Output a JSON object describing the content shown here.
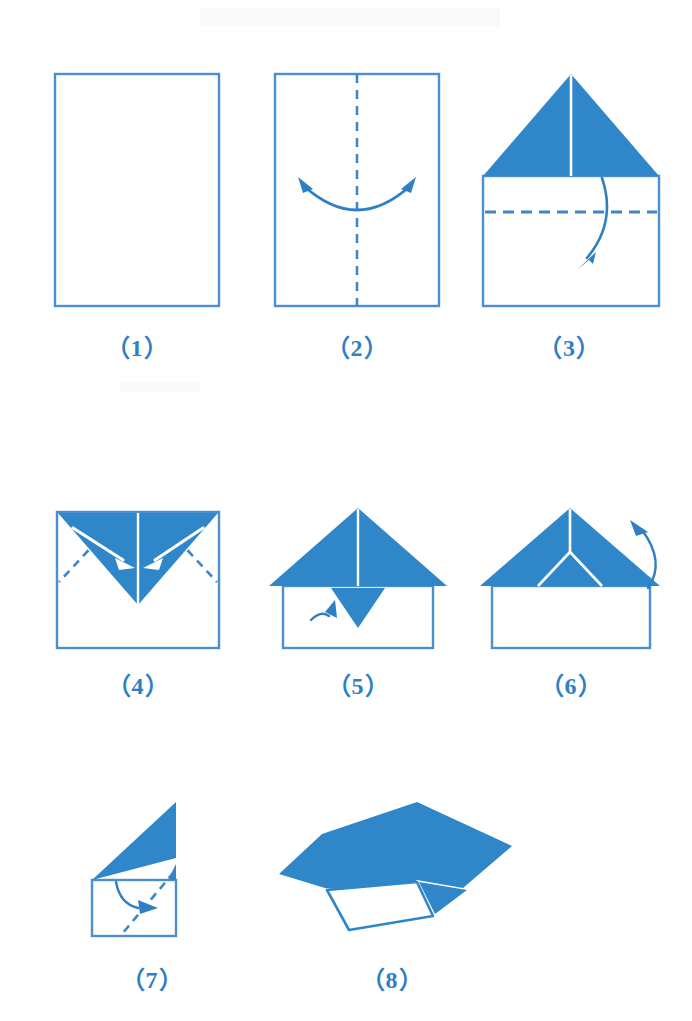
{
  "document": {
    "title": "Paper Airplane Folding Instructions",
    "kind": "origami-step-diagram",
    "step_count": 8,
    "background_color": "#ffffff"
  },
  "palette": {
    "paper_blue_fill": "#2f87c9",
    "outline_blue": "#4a90d0",
    "crease_dash_blue": "#3d86cb",
    "arrow_blue": "#2f7fc4",
    "arrow_white": "#ffffff",
    "caption_blue": "#2f7fc4",
    "paper_white": "#ffffff"
  },
  "steps": [
    {
      "id": "step-1",
      "caption": "（1）",
      "number": "1",
      "description": "Start with a plain rectangular sheet of paper, portrait orientation.",
      "figure_name": "plain-rectangle-figure",
      "shapes": [
        "rectangle-outline"
      ],
      "arrows": [],
      "creases": []
    },
    {
      "id": "step-2",
      "caption": "（2）",
      "number": "2",
      "description": "Fold the sheet in half vertically to make a center crease, then unfold.",
      "figure_name": "center-crease-figure",
      "shapes": [
        "rectangle-outline"
      ],
      "arrows": [
        "double-headed-curved-arrow"
      ],
      "creases": [
        "vertical-center-dashed-line"
      ]
    },
    {
      "id": "step-3",
      "caption": "（3）",
      "number": "3",
      "description": "Fold both top corners down to the center line, forming a blue triangular roof; then fold the band below down.",
      "figure_name": "corners-folded-figure",
      "shapes": [
        "blue-triangle-roof",
        "white-body-rectangle",
        "vertical-center-line"
      ],
      "arrows": [
        "down-curved-arrow"
      ],
      "creases": [
        "horizontal-dashed-line"
      ]
    },
    {
      "id": "step-4",
      "caption": "（4）",
      "number": "4",
      "description": "The band is folded down over the triangle. Fold the two outer corners inward along the diagonal creases.",
      "figure_name": "inverted-v-figure",
      "shapes": [
        "blue-inverted-v",
        "white-body-rectangle",
        "vertical-center-line"
      ],
      "arrows": [
        "white-arrow-left",
        "white-arrow-right"
      ],
      "creases": [
        "diagonal-dashed-left",
        "diagonal-dashed-right"
      ]
    },
    {
      "id": "step-5",
      "caption": "（5）",
      "number": "5",
      "description": "The corners now form a wide triangle with a small downward point. Fold the small point upward.",
      "figure_name": "small-flap-down-figure",
      "shapes": [
        "blue-wide-triangle",
        "white-body-rectangle",
        "small-down-triangle-flap",
        "vertical-center-line"
      ],
      "arrows": [
        "small-up-curved-arrow"
      ],
      "creases": []
    },
    {
      "id": "step-6",
      "caption": "（6）",
      "number": "6",
      "description": "Small point is folded up and tucked. Turn the model over / fold it in half behind.",
      "figure_name": "flap-tucked-figure",
      "shapes": [
        "blue-wide-triangle",
        "white-body-rectangle",
        "white-y-crease"
      ],
      "arrows": [
        "over-the-top-curved-arrow"
      ],
      "creases": []
    },
    {
      "id": "step-7",
      "caption": "（7）",
      "number": "7",
      "description": "Side view of the folded model. Fold the wing down along the dashed diagonal to form the airplane wing.",
      "figure_name": "side-view-wing-figure",
      "shapes": [
        "blue-wing-triangle",
        "white-body-rectangle"
      ],
      "arrows": [
        "wing-fold-curved-arrow"
      ],
      "creases": [
        "diagonal-dashed-fold"
      ]
    },
    {
      "id": "step-8",
      "caption": "（8）",
      "number": "8",
      "description": "The completed paper airplane shown in perspective.",
      "figure_name": "finished-airplane-figure",
      "shapes": [
        "blue-wing-body",
        "white-underside-panel"
      ],
      "arrows": [],
      "creases": []
    }
  ]
}
